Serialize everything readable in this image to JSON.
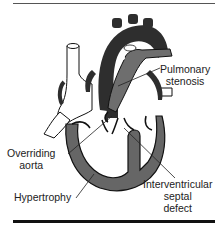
{
  "diagram": {
    "labels": {
      "pulmonary_stenosis": [
        "Pulmonary",
        "stenosis"
      ],
      "overriding_aorta": [
        "Overriding",
        "aorta"
      ],
      "hypertrophy": [
        "Hypertrophy"
      ],
      "interventricular_septal_defect": [
        "Interventricular",
        "septal",
        "defect"
      ]
    },
    "colors": {
      "aorta": "#2e2e2e",
      "pulmonary_artery": "#6e6e6e",
      "myocardium": "#666666",
      "outline": "#111111",
      "vessel_white": "#ffffff",
      "rule": "#111111"
    }
  }
}
